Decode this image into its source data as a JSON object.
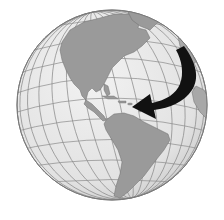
{
  "image": {
    "subject": "Globe centered on the Americas with a black curved arrow",
    "description": "Grayscale orthographic globe showing North America, Central America, the Caribbean and South America on a graticule grid; a thick black curved arrow sweeps from the upper right (North Atlantic) down and points west toward the Caribbean.",
    "colors": {
      "background": "#ffffff",
      "ocean": "#e6e6e6",
      "land": "#9a9a9a",
      "graticule": "#8a8a8a",
      "outline": "#7a7a7a",
      "arrow": "#111111"
    },
    "elements": {
      "globe": "globe",
      "arrow": "arrow pointing toward Caribbean"
    }
  }
}
